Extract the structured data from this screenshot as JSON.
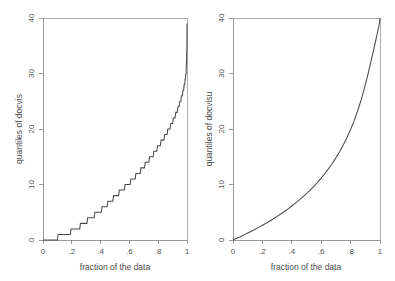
{
  "figure": {
    "background": "#ffffff",
    "line_color": "#4a4a4a",
    "axis_color": "#808080",
    "panel_count": 2
  },
  "chart_data": [
    {
      "type": "line",
      "panel": "left",
      "title": "",
      "xlabel": "fraction of the data",
      "ylabel": "quantiles of docvis",
      "xlim": [
        0,
        1
      ],
      "ylim": [
        0,
        40
      ],
      "xticks": [
        0,
        0.2,
        0.4,
        0.6,
        0.8,
        1
      ],
      "xticklabels": [
        "0",
        ".2",
        ".4",
        ".6",
        ".8",
        "1"
      ],
      "yticks": [
        0,
        10,
        20,
        30,
        40
      ],
      "yticklabels": [
        "0",
        "10",
        "20",
        "30",
        "40"
      ],
      "grid": false,
      "legend": false,
      "step": true,
      "step_note": "empirical quantiles of a discrete count variable, drawn as a staircase",
      "x": [
        0.0,
        0.1,
        0.105,
        0.19,
        0.195,
        0.255,
        0.26,
        0.305,
        0.31,
        0.355,
        0.36,
        0.405,
        0.41,
        0.445,
        0.45,
        0.485,
        0.49,
        0.525,
        0.53,
        0.565,
        0.57,
        0.605,
        0.61,
        0.64,
        0.645,
        0.675,
        0.68,
        0.705,
        0.71,
        0.735,
        0.74,
        0.765,
        0.77,
        0.79,
        0.795,
        0.815,
        0.82,
        0.84,
        0.845,
        0.862,
        0.867,
        0.882,
        0.887,
        0.9,
        0.905,
        0.917,
        0.922,
        0.932,
        0.937,
        0.945,
        0.95,
        0.957,
        0.962,
        0.968,
        0.972,
        0.977,
        0.98,
        0.984,
        0.987,
        0.99,
        0.992,
        0.994,
        0.996,
        0.997,
        0.998,
        0.999,
        1.0
      ],
      "y": [
        0,
        0,
        1,
        1,
        2,
        2,
        3,
        3,
        4,
        4,
        5,
        5,
        6,
        6,
        7,
        7,
        8,
        8,
        9,
        9,
        10,
        10,
        11,
        11,
        12,
        12,
        13,
        13,
        14,
        14,
        15,
        15,
        16,
        16,
        17,
        17,
        18,
        18,
        19,
        19,
        20,
        20,
        21,
        21,
        22,
        22,
        23,
        23,
        24,
        24,
        25,
        25,
        26,
        26,
        27,
        27,
        28,
        28,
        29,
        29,
        30,
        30,
        32,
        32,
        34,
        34,
        39
      ]
    },
    {
      "type": "line",
      "panel": "right",
      "title": "",
      "xlabel": "fraction of the data",
      "ylabel": "quantiles of docvisu",
      "xlim": [
        0,
        1
      ],
      "ylim": [
        0,
        40
      ],
      "xticks": [
        0,
        0.2,
        0.4,
        0.6,
        0.8,
        1
      ],
      "xticklabels": [
        "0",
        ".2",
        ".4",
        ".6",
        ".8",
        "1"
      ],
      "yticks": [
        0,
        10,
        20,
        30,
        40
      ],
      "yticklabels": [
        "0",
        "10",
        "20",
        "30",
        "40"
      ],
      "grid": false,
      "legend": false,
      "step": false,
      "step_note": "smooth continuous quantile function",
      "x": [
        0.0,
        0.025,
        0.05,
        0.075,
        0.1,
        0.125,
        0.15,
        0.175,
        0.2,
        0.225,
        0.25,
        0.275,
        0.3,
        0.325,
        0.35,
        0.375,
        0.4,
        0.425,
        0.45,
        0.475,
        0.5,
        0.525,
        0.55,
        0.575,
        0.6,
        0.625,
        0.65,
        0.675,
        0.7,
        0.725,
        0.75,
        0.775,
        0.8,
        0.825,
        0.85,
        0.87,
        0.89,
        0.905,
        0.92,
        0.932,
        0.944,
        0.954,
        0.962,
        0.97,
        0.976,
        0.981,
        0.985,
        0.988,
        0.991,
        0.993,
        0.995,
        0.996,
        0.997,
        0.998,
        0.999,
        1.0
      ],
      "y": [
        0.0,
        0.3,
        0.6,
        0.92,
        1.25,
        1.58,
        1.92,
        2.28,
        2.65,
        3.02,
        3.42,
        3.82,
        4.25,
        4.68,
        5.14,
        5.62,
        6.12,
        6.64,
        7.18,
        7.76,
        8.36,
        9.0,
        9.68,
        10.4,
        11.16,
        11.98,
        12.85,
        13.78,
        14.8,
        15.9,
        17.1,
        18.42,
        19.9,
        21.55,
        23.42,
        25.1,
        26.95,
        28.45,
        30.05,
        31.4,
        32.8,
        33.95,
        34.9,
        35.85,
        36.55,
        37.15,
        37.65,
        38.0,
        38.4,
        38.65,
        38.95,
        39.1,
        39.28,
        39.48,
        39.72,
        40.0
      ]
    }
  ]
}
